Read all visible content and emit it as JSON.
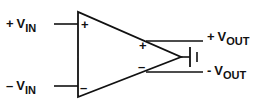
{
  "diagram": {
    "inputs": {
      "positive": {
        "sign": "+",
        "symbol": "V",
        "subscript": "IN"
      },
      "negative": {
        "sign": "–",
        "symbol": "V",
        "subscript": "IN"
      }
    },
    "amplifier_pins": {
      "in_plus": "+",
      "in_minus": "–",
      "out_plus": "+",
      "out_minus": "–"
    },
    "outputs": {
      "positive": {
        "sign": "+",
        "symbol": "V",
        "subscript": "OUT"
      },
      "negative": {
        "sign": "-",
        "symbol": "V",
        "subscript": "OUT"
      }
    },
    "components": [
      "op-amp-triangle",
      "capacitor-symbol"
    ],
    "colors": {
      "stroke": "#111111",
      "background": "#ffffff"
    }
  }
}
